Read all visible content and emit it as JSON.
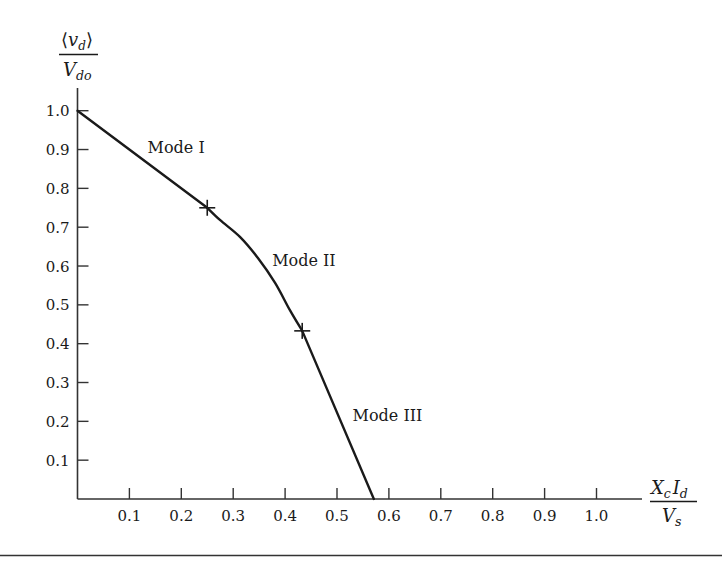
{
  "chart_data": {
    "type": "line",
    "title": "",
    "xlabel": "X_c I_d / V_s",
    "ylabel": "⟨v_d⟩ / V_do",
    "xlabel_parts": {
      "numerator": [
        {
          "t": "X",
          "sub": "c"
        },
        {
          "t": "I",
          "sub": "d"
        }
      ],
      "denominator": [
        {
          "t": "V",
          "sub": "s"
        }
      ]
    },
    "ylabel_parts": {
      "numerator": {
        "open": "⟨",
        "t": "v",
        "sub": "d",
        "close": "⟩"
      },
      "denominator": {
        "t": "V",
        "sub": "do"
      }
    },
    "xlim": [
      0,
      1.1
    ],
    "ylim": [
      0,
      1.05
    ],
    "x_ticks": [
      0.1,
      0.2,
      0.3,
      0.4,
      0.5,
      0.6,
      0.7,
      0.8,
      0.9,
      1.0
    ],
    "x_tick_labels": [
      "0.1",
      "0.2",
      "0.3",
      "0.4",
      "0.5",
      "0.6",
      "0.7",
      "0.8",
      "0.9",
      "1.0"
    ],
    "y_ticks": [
      0.1,
      0.2,
      0.3,
      0.4,
      0.5,
      0.6,
      0.7,
      0.8,
      0.9,
      1.0
    ],
    "y_tick_labels": [
      "0.1",
      "0.2",
      "0.3",
      "0.4",
      "0.5",
      "0.6",
      "0.7",
      "0.8",
      "0.9",
      "1.0"
    ],
    "grid": false,
    "legend": null,
    "series": [
      {
        "name": "Mode I",
        "points": [
          [
            0.0,
            1.0
          ],
          [
            0.25,
            0.75
          ]
        ]
      },
      {
        "name": "Mode II",
        "points": [
          [
            0.25,
            0.75
          ],
          [
            0.275,
            0.718
          ],
          [
            0.313,
            0.675
          ],
          [
            0.348,
            0.62
          ],
          [
            0.381,
            0.556
          ],
          [
            0.409,
            0.487
          ],
          [
            0.433,
            0.433
          ]
        ]
      },
      {
        "name": "Mode III",
        "points": [
          [
            0.433,
            0.433
          ],
          [
            0.571,
            0.0
          ]
        ]
      }
    ],
    "markers": [
      {
        "x": 0.25,
        "y": 0.75,
        "symbol": "+",
        "label": "Mode I / Mode II boundary"
      },
      {
        "x": 0.433,
        "y": 0.433,
        "symbol": "+",
        "label": "Mode II / Mode III boundary"
      }
    ],
    "annotations": [
      {
        "text": "Mode I",
        "x": 0.135,
        "y": 0.89
      },
      {
        "text": "Mode II",
        "x": 0.375,
        "y": 0.6
      },
      {
        "text": "Mode III",
        "x": 0.53,
        "y": 0.2
      }
    ],
    "x_intercept": 0.571,
    "line_color": "#1a1a1a"
  }
}
